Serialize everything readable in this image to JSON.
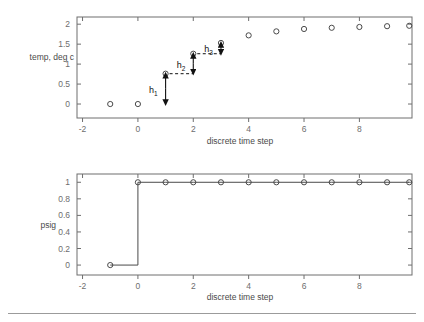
{
  "figure": {
    "width": 424,
    "height": 322,
    "background": "#ffffff",
    "axis_color": "#6e6e6e",
    "marker_color": "#4a4a4a",
    "annotation_color": "#111111",
    "footer_rule_color": "#9b9b9b"
  },
  "chart_data": [
    {
      "type": "scatter",
      "name": "temperature-response",
      "title": "",
      "xlabel": "discrete time step",
      "ylabel": "temp, deg c",
      "xlim": [
        -2.2,
        9.9
      ],
      "ylim": [
        -0.35,
        2.18
      ],
      "xticks": [
        -2,
        0,
        2,
        4,
        6,
        8
      ],
      "xticklabels": [
        "-2",
        "0",
        "2",
        "4",
        "6",
        "8"
      ],
      "yticks": [
        0,
        0.5,
        1,
        1.5,
        2
      ],
      "yticklabels": [
        "0",
        "0.5",
        "1",
        "1.5",
        "2"
      ],
      "grid": false,
      "legend": "none",
      "marker": "open-circle",
      "x": [
        -1,
        0,
        1,
        2,
        3,
        4,
        5,
        6,
        7,
        8,
        9,
        9.8
      ],
      "y": [
        0,
        0,
        0.76,
        1.26,
        1.53,
        1.72,
        1.82,
        1.88,
        1.91,
        1.93,
        1.95,
        1.96
      ],
      "annotations": [
        {
          "label": "h",
          "subscript": "1",
          "x": 1,
          "y_top": 0.76,
          "y_bottom": 0.0,
          "leader_from_x": 1,
          "leader_to_x": 2,
          "leader_y": 0.76
        },
        {
          "label": "h",
          "subscript": "2",
          "x": 2,
          "y_top": 1.26,
          "y_bottom": 0.76,
          "leader_from_x": 2,
          "leader_to_x": 3,
          "leader_y": 1.26
        },
        {
          "label": "h",
          "subscript": "3",
          "x": 3,
          "y_top": 1.53,
          "y_bottom": 1.26,
          "leader_from_x": 3,
          "leader_to_x": 3,
          "leader_y": 1.53
        }
      ]
    },
    {
      "type": "line",
      "name": "pressure-step-signal",
      "title": "",
      "xlabel": "discrete time step",
      "ylabel": "psig",
      "xlim": [
        -2.2,
        9.9
      ],
      "ylim": [
        -0.12,
        1.1
      ],
      "xticks": [
        -2,
        0,
        2,
        4,
        6,
        8
      ],
      "xticklabels": [
        "-2",
        "0",
        "2",
        "4",
        "6",
        "8"
      ],
      "yticks": [
        0,
        0.2,
        0.4,
        0.6,
        0.8,
        1
      ],
      "yticklabels": [
        "0",
        "0.2",
        "0.4",
        "0.6",
        "0.8",
        "1"
      ],
      "grid": false,
      "legend": "none",
      "marker": "open-circle",
      "drawstyle": "steps-post",
      "x": [
        -1,
        0,
        1,
        2,
        3,
        4,
        5,
        6,
        7,
        8,
        9,
        9.8
      ],
      "y": [
        0,
        1,
        1,
        1,
        1,
        1,
        1,
        1,
        1,
        1,
        1,
        1
      ]
    }
  ]
}
